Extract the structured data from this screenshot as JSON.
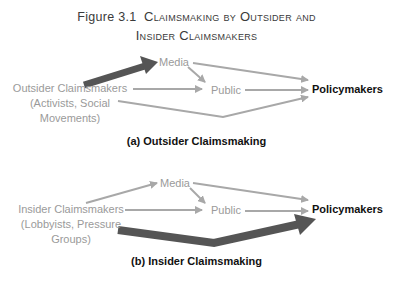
{
  "figure": {
    "number": "Figure 3.1",
    "title_line1": "Claimsmaking by Outsider and",
    "title_line2": "Insider Claimsmakers"
  },
  "panels": [
    {
      "caption": "(a) Outsider Claimsmaking",
      "source_label": [
        "Outsider Claimsmakers",
        "(Activists, Social",
        "Movements)"
      ],
      "media_label": "Media",
      "public_label": "Public",
      "target_label": "Policymakers",
      "emphasized_path": "source-to-media"
    },
    {
      "caption": "(b) Insider Claimsmaking",
      "source_label": [
        "Insider Claimsmakers",
        "(Lobbyists, Pressure",
        "Groups)"
      ],
      "media_label": "Media",
      "public_label": "Public",
      "target_label": "Policymakers",
      "emphasized_path": "source-to-policymakers"
    }
  ],
  "colors": {
    "arrow_thin": "#a8a8a8",
    "arrow_thick": "#555555",
    "label_gray": "#9a9a9a",
    "label_dark": "#111111"
  }
}
